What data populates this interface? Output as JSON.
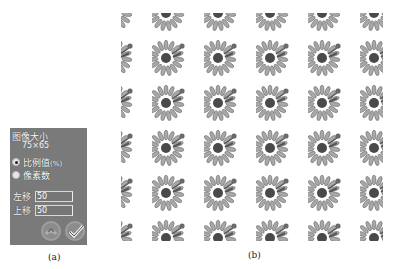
{
  "panel_a": {
    "title": "图像大小",
    "size_text": "75×65",
    "radio_options": [
      {
        "label": "比例值",
        "suffix": "(%)",
        "checked": true
      },
      {
        "label": "像素数",
        "suffix": "",
        "checked": false
      }
    ],
    "fields": [
      {
        "label": "左移",
        "value": "50"
      },
      {
        "label": "上移",
        "value": "50"
      }
    ],
    "buttons": [
      {
        "icon": "undo-icon"
      },
      {
        "icon": "checkmark-icon"
      }
    ],
    "caption": "(a)"
  },
  "panel_b": {
    "caption": "(b)",
    "tile_icon": "sunflower-icon",
    "grid": {
      "columns": 6,
      "rows": 6,
      "col_spacing_px": 52,
      "row_spacing_px": 45
    }
  },
  "colors": {
    "panel_bg": "#7a7a7a",
    "text_light": "#ffffff",
    "petal": "#9a9a9a",
    "center": "#4a4a4a"
  }
}
